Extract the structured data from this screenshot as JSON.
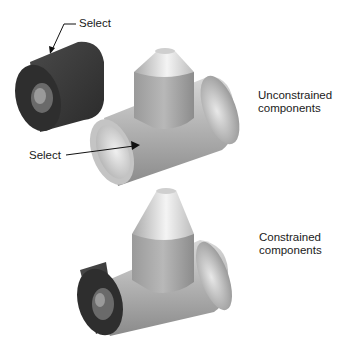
{
  "figure": {
    "type": "assembly-constraint-illustration",
    "top_view": {
      "caption_line1": "Unconstrained",
      "caption_line2": "components",
      "callouts": [
        {
          "label": "Select",
          "target": "bushing-outer-face"
        },
        {
          "label": "Select",
          "target": "tee-inner-bore"
        }
      ]
    },
    "bottom_view": {
      "caption_line1": "Constrained",
      "caption_line2": "components"
    },
    "parts": [
      "bushing",
      "pipe-tee"
    ],
    "colors": {
      "bushing": "#3a3a3a",
      "tee": "#b8b8b8",
      "background": "#ffffff"
    }
  }
}
